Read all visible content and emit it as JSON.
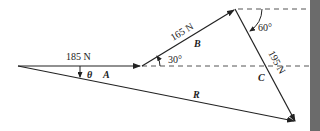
{
  "diagram": {
    "type": "vector-addition",
    "vectors": [
      {
        "name": "A",
        "magnitude_label": "185 N",
        "angle_label": ""
      },
      {
        "name": "B",
        "magnitude_label": "165 N",
        "angle_label": "30°"
      },
      {
        "name": "C",
        "magnitude_label": "195 N",
        "angle_label": "60°"
      },
      {
        "name": "R",
        "magnitude_label": "",
        "angle_label": ""
      }
    ],
    "theta_label": "θ",
    "colors": {
      "line": "#222222",
      "dashed": "#555555",
      "side_bar": "#6b6b6b",
      "background": "#ffffff"
    }
  }
}
